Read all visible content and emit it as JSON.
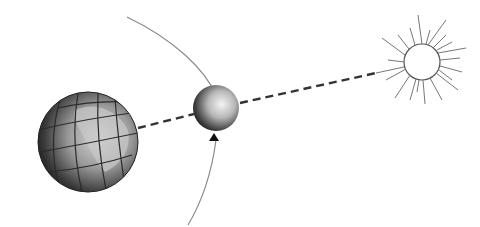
{
  "diagram": {
    "bodies": [
      {
        "name": "earth",
        "cx": 88,
        "cy": 142,
        "r": 50
      },
      {
        "name": "moon",
        "cx": 216,
        "cy": 108,
        "r": 23
      },
      {
        "name": "sun",
        "cx": 422,
        "cy": 62,
        "r": 18
      }
    ],
    "orbit": {
      "direction": "counterclockwise-arrow-up"
    },
    "line_of_sight": {
      "style": "dashed"
    },
    "colors": {
      "stroke": "#333333",
      "orbit": "#8a8a8a",
      "sun_rays": "#777777",
      "background": "#ffffff"
    }
  }
}
